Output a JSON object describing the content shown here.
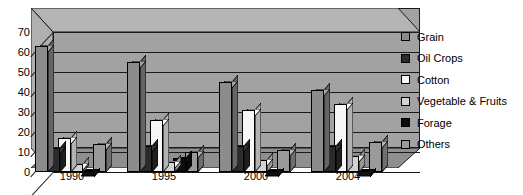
{
  "chart_data": {
    "type": "bar",
    "title": "",
    "subtitle": "",
    "xlabel": "",
    "ylabel": "",
    "ylim": [
      0,
      70
    ],
    "ytick_step": 10,
    "yticks": [
      0,
      10,
      20,
      30,
      40,
      50,
      60,
      70
    ],
    "ytick_labels": [
      "0",
      "10",
      "20",
      "30",
      "40",
      "50",
      "60",
      "70"
    ],
    "grid": true,
    "grid_axis": "y",
    "legend_position": "right",
    "three_d": true,
    "categories": [
      "1990",
      "1995",
      "2000",
      "2004"
    ],
    "series": [
      {
        "name": "Grain",
        "color": "#8c8c8c",
        "values": [
          63,
          55,
          45,
          41
        ]
      },
      {
        "name": "Oil Crops",
        "color": "#2b2b2b",
        "values": [
          12,
          13,
          13,
          13
        ]
      },
      {
        "name": "Cotton",
        "color": "#f7f7f7",
        "values": [
          17,
          26,
          31,
          34
        ]
      },
      {
        "name": "Vegetable & Fruits",
        "color": "#d2d2d2",
        "values": [
          4,
          5,
          6,
          8
        ]
      },
      {
        "name": "Forage",
        "color": "#0d0d0d",
        "values": [
          1,
          7,
          1,
          1
        ]
      },
      {
        "name": "Others",
        "color": "#9a9a9a",
        "values": [
          14,
          10,
          11,
          15
        ]
      }
    ]
  },
  "legend": {
    "items": [
      {
        "label": "Grain"
      },
      {
        "label": "Oil Crops"
      },
      {
        "label": "Cotton"
      },
      {
        "label": "Vegetable & Fruits"
      },
      {
        "label": "Forage"
      },
      {
        "label": "Others"
      }
    ]
  },
  "axes": {
    "y_labels": [
      "70",
      "60",
      "50",
      "40",
      "30",
      "20",
      "10",
      "0"
    ],
    "x_labels": [
      "1990",
      "1995",
      "2000",
      "2004"
    ]
  },
  "colors": {
    "plot_background": "#a2a2a2",
    "wall_shade": "#b4b4b4",
    "floor_shade": "#8f8f8f",
    "axis_line": "#1a1a1a",
    "text": "#000000"
  }
}
